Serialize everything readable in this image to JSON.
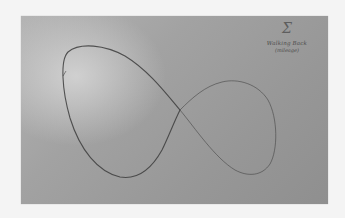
{
  "image": {
    "subject": "Hand-drawn figure-eight (infinity) curve on a sheet of gray paper",
    "colors": {
      "background": "#f4f4f4",
      "paper": "#9e9e9e",
      "paper_highlight": "#d0d0d0",
      "ink": "#4a4a4a"
    }
  },
  "annotation": {
    "symbol": "Σ",
    "line1": "Walking Back",
    "line2": "(mileage)"
  }
}
